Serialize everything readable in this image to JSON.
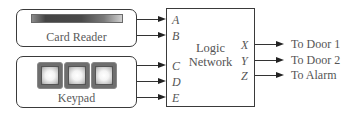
{
  "diagram": {
    "title": "",
    "devices": {
      "card_reader": {
        "label": "Card Reader"
      },
      "keypad": {
        "label": "Keypad",
        "key_count": 3
      }
    },
    "logic_network": {
      "label_line1": "Logic",
      "label_line2": "Network",
      "inputs": [
        "A",
        "B",
        "C",
        "D",
        "E"
      ],
      "outputs": [
        "X",
        "Y",
        "Z"
      ]
    },
    "connections": {
      "card_reader_to": [
        "A",
        "B"
      ],
      "keypad_to": [
        "C",
        "D",
        "E"
      ]
    },
    "output_destinations": [
      {
        "port": "X",
        "label": "To Door 1"
      },
      {
        "port": "Y",
        "label": "To Door 2"
      },
      {
        "port": "Z",
        "label": "To Alarm"
      }
    ],
    "colors": {
      "line": "#333333",
      "text": "#555555",
      "slot_dark": "#444444"
    }
  }
}
